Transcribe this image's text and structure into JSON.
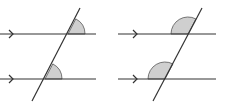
{
  "diagrams": [
    {
      "name": "corresponding-angles",
      "parallel_lines": [
        {
          "x1": 0,
          "y1": 34,
          "x2": 96,
          "y2": 34,
          "arrow_x": 13
        },
        {
          "x1": 0,
          "y1": 79,
          "x2": 96,
          "y2": 79,
          "arrow_x": 13
        }
      ],
      "transversal": {
        "x1": 80,
        "y1": 8,
        "x2": 32,
        "y2": 101
      },
      "angles": [
        {
          "cx": 68,
          "cy": 34,
          "r": 17,
          "side": "upper-right"
        },
        {
          "cx": 45,
          "cy": 79,
          "r": 17,
          "side": "upper-right"
        }
      ]
    },
    {
      "name": "corresponding-angles-left",
      "parallel_lines": [
        {
          "x1": 118,
          "y1": 34,
          "x2": 216,
          "y2": 34,
          "arrow_x": 137
        },
        {
          "x1": 118,
          "y1": 79,
          "x2": 216,
          "y2": 79,
          "arrow_x": 137
        }
      ],
      "transversal": {
        "x1": 202,
        "y1": 8,
        "x2": 153,
        "y2": 101
      },
      "angles": [
        {
          "cx": 188,
          "cy": 34,
          "r": 17,
          "side": "upper-left"
        },
        {
          "cx": 165,
          "cy": 79,
          "r": 17,
          "side": "upper-left"
        }
      ]
    }
  ],
  "colors": {
    "line": "#333333",
    "angle_fill": "#cfcfcf",
    "angle_stroke": "#555555"
  }
}
